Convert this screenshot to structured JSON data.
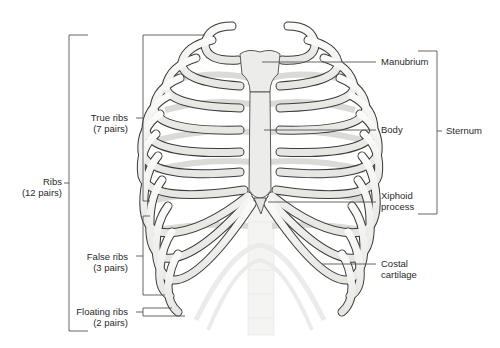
{
  "diagram": {
    "colors": {
      "bone": "#f4f4f2",
      "bone_outline": "#3a3a3a",
      "cartilage": "#dcdcd8",
      "leader_line": "#555555",
      "text": "#2a2a2a",
      "background": "#ffffff"
    }
  },
  "labels": {
    "left": {
      "ribs": {
        "line1": "Ribs",
        "line2": "(12 pairs)"
      },
      "true_ribs": {
        "line1": "True ribs",
        "line2": "(7 pairs)"
      },
      "false_ribs": {
        "line1": "False ribs",
        "line2": "(3 pairs)"
      },
      "floating_ribs": {
        "line1": "Floating ribs",
        "line2": "(2 pairs)"
      }
    },
    "right": {
      "manubrium": {
        "line1": "Manubrium"
      },
      "body": {
        "line1": "Body"
      },
      "xiphoid": {
        "line1": "Xiphoid",
        "line2": "process"
      },
      "costal": {
        "line1": "Costal",
        "line2": "cartilage"
      },
      "sternum": {
        "line1": "Sternum"
      }
    }
  }
}
